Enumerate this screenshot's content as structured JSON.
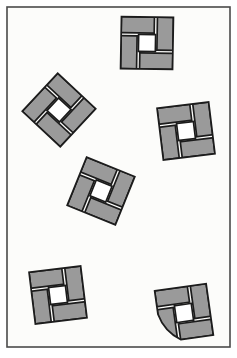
{
  "figure": {
    "canvas": {
      "width": 237,
      "height": 358
    },
    "frame": {
      "name": "panel-border",
      "x": 7,
      "y": 7,
      "width": 223,
      "height": 340,
      "fill": "#fcfcfa",
      "stroke": "#4a4a4a",
      "stroke_width": 1.6
    },
    "style": {
      "tile_fill": "#9a9a9a",
      "tile_stroke": "#1c1c1c",
      "tile_stroke_width": 1.7,
      "center_hole_fill": "#ffffff",
      "center_hole_stroke": "#1c1c1c",
      "background": "#fcfcfa"
    },
    "shapes": [
      {
        "id": "tile-top",
        "label": "Top tile",
        "cx": 147,
        "cy": 43,
        "size": 52,
        "hole": 17,
        "gap": 3.0,
        "rotation": 1,
        "rounded_corner": false,
        "corner_radius": 0
      },
      {
        "id": "tile-upper-left",
        "label": "Upper left tile",
        "cx": 59,
        "cy": 110,
        "size": 52,
        "hole": 17,
        "gap": 3.0,
        "rotation": 43,
        "rounded_corner": false,
        "corner_radius": 0
      },
      {
        "id": "tile-right",
        "label": "Right tile",
        "cx": 186,
        "cy": 131,
        "size": 52,
        "hole": 17,
        "gap": 3.0,
        "rotation": -7,
        "rounded_corner": false,
        "corner_radius": 0
      },
      {
        "id": "tile-center",
        "label": "Center tile",
        "cx": 101,
        "cy": 191,
        "size": 52,
        "hole": 17,
        "gap": 3.0,
        "rotation": 22,
        "rounded_corner": false,
        "corner_radius": 0
      },
      {
        "id": "tile-bottom-left",
        "label": "Bottom left tile",
        "cx": 58,
        "cy": 295,
        "size": 52,
        "hole": 17,
        "gap": 3.0,
        "rotation": -7,
        "rounded_corner": false,
        "corner_radius": 0
      },
      {
        "id": "tile-bottom-right-rounded",
        "label": "Bottom right tile with rounded corner",
        "cx": 184,
        "cy": 313,
        "size": 52,
        "hole": 17,
        "gap": 3.0,
        "rotation": -8,
        "rounded_corner": true,
        "corner_radius": 46
      }
    ]
  }
}
